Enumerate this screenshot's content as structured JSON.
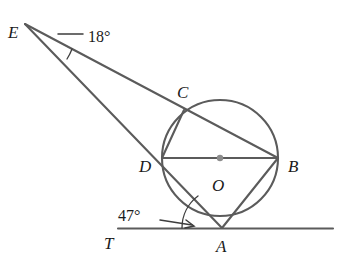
{
  "figure": {
    "type": "geometry-diagram",
    "background_color": "#ffffff",
    "line_color": "#5b5b5b",
    "label_color": "#1a1a1a",
    "center_dot_color": "#8c8c8c"
  },
  "points": {
    "E": {
      "label": "E",
      "x": 25,
      "y": 24,
      "label_x": 8,
      "label_y": 38
    },
    "C": {
      "label": "C",
      "x": 184,
      "y": 110,
      "label_x": 177,
      "label_y": 98
    },
    "D": {
      "label": "D",
      "x": 162,
      "y": 158,
      "label_x": 139,
      "label_y": 172
    },
    "B": {
      "label": "B",
      "x": 278,
      "y": 158,
      "label_x": 288,
      "label_y": 172
    },
    "O": {
      "label": "O",
      "x": 220,
      "y": 158,
      "label_x": 212,
      "label_y": 191
    },
    "A": {
      "label": "A",
      "x": 222,
      "y": 228,
      "label_x": 216,
      "label_y": 252
    },
    "T": {
      "label": "T",
      "x": 118,
      "y": 228,
      "label_x": 104,
      "label_y": 249
    }
  },
  "circle": {
    "center_x": 220,
    "center_y": 158,
    "radius": 58
  },
  "angles": [
    {
      "name": "angle-at-E",
      "value": "18°",
      "label_x": 78,
      "label_y": 42,
      "vertex": "E"
    },
    {
      "name": "angle-at-A",
      "value": "47°",
      "label_x": 140,
      "label_y": 220,
      "vertex": "A"
    }
  ],
  "segments": [
    {
      "name": "secant-E-C-B",
      "from": "E",
      "to": "B"
    },
    {
      "name": "secant-E-D-A",
      "from": "E",
      "to": "A"
    },
    {
      "name": "diameter-D-B",
      "from": "D",
      "to": "B"
    },
    {
      "name": "chord-A-B",
      "from": "A",
      "to": "B"
    },
    {
      "name": "chord-D-C",
      "from": "D",
      "to": "C"
    },
    {
      "name": "tangent-line-T",
      "from": "T",
      "to": "right-edge"
    }
  ]
}
